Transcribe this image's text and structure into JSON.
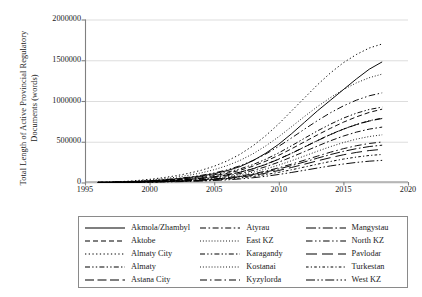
{
  "chart_data": {
    "type": "line",
    "title": "",
    "xlabel": "",
    "ylabel": "Total Length of Active Provincial Regulatory Documents (words)",
    "ylabel_line1": "Total Length of Active Provincial Regulatory",
    "ylabel_line2": "Documents (words)",
    "xlim": [
      1995,
      2020
    ],
    "ylim": [
      0,
      2000000
    ],
    "xticks": [
      1995,
      2000,
      2005,
      2010,
      2015,
      2020
    ],
    "xtick_labels": [
      "1995",
      "2000",
      "2005",
      "2010",
      "2015",
      "2020"
    ],
    "yticks": [
      0,
      500000,
      1000000,
      1500000,
      2000000
    ],
    "ytick_labels": [
      "0",
      "500000",
      "1000000",
      "1500000",
      "2000000"
    ],
    "grid": "horizontal",
    "legend_position": "below",
    "legend_columns": 3,
    "legend_rows": 5,
    "line_color": "#000000",
    "grid_color": "#d9d9d9",
    "axis_color": "#808080",
    "x": [
      1996,
      1997,
      1998,
      1999,
      2000,
      2001,
      2002,
      2003,
      2004,
      2005,
      2006,
      2007,
      2008,
      2009,
      2010,
      2011,
      2012,
      2013,
      2014,
      2015,
      2016,
      2017,
      2018
    ],
    "series": [
      {
        "name": "Akmola/Zhambyl",
        "dash": "solid",
        "values": [
          1000,
          3000,
          7000,
          13000,
          21000,
          31000,
          44000,
          60000,
          80000,
          108000,
          145000,
          195000,
          268000,
          360000,
          470000,
          600000,
          740000,
          880000,
          1010000,
          1140000,
          1270000,
          1390000,
          1480000
        ]
      },
      {
        "name": "Aktobe",
        "dash": "dashed",
        "values": [
          800,
          2200,
          5000,
          9000,
          15000,
          23000,
          33000,
          46000,
          62000,
          84000,
          112000,
          150000,
          200000,
          262000,
          334000,
          415000,
          500000,
          585000,
          665000,
          740000,
          805000,
          860000,
          900000
        ]
      },
      {
        "name": "Almaty City",
        "dash": "dotted",
        "values": [
          2000,
          6000,
          13000,
          24000,
          39000,
          58000,
          82000,
          112000,
          150000,
          200000,
          264000,
          346000,
          450000,
          576000,
          720000,
          880000,
          1040000,
          1200000,
          1345000,
          1470000,
          1570000,
          1650000,
          1700000
        ]
      },
      {
        "name": "Almaty",
        "dash": "dashdotdot",
        "values": [
          700,
          1900,
          4200,
          7800,
          12800,
          19500,
          28000,
          39000,
          53000,
          71000,
          95000,
          127000,
          170000,
          224000,
          288000,
          360000,
          438000,
          516000,
          590000,
          656000,
          712000,
          758000,
          790000
        ]
      },
      {
        "name": "Astana City",
        "dash": "longdash",
        "values": [
          600,
          1700,
          3900,
          7300,
          12000,
          18500,
          27000,
          38000,
          52000,
          70000,
          94000,
          126000,
          168000,
          222000,
          286000,
          358000,
          436000,
          514000,
          588000,
          654000,
          710000,
          754000,
          785000
        ]
      },
      {
        "name": "Atyrau",
        "dash": "dashdot",
        "values": [
          500,
          1500,
          3400,
          6400,
          10500,
          16200,
          23500,
          33000,
          45000,
          61000,
          82000,
          110000,
          147000,
          194000,
          250000,
          313000,
          380000,
          448000,
          512000,
          570000,
          618000,
          655000,
          680000
        ]
      },
      {
        "name": "East KZ",
        "dash": "fine-dotted",
        "values": [
          1500,
          4500,
          10000,
          18500,
          30000,
          45000,
          64000,
          88000,
          118000,
          157000,
          207000,
          271000,
          352000,
          450000,
          562000,
          686000,
          812000,
          932000,
          1042000,
          1140000,
          1222000,
          1286000,
          1330000
        ]
      },
      {
        "name": "Karagandy",
        "dash": "dashdotdot",
        "values": [
          900,
          2600,
          5800,
          10800,
          17500,
          26500,
          38000,
          52500,
          71000,
          95000,
          126000,
          167000,
          220000,
          286000,
          364000,
          452000,
          544000,
          634000,
          716000,
          790000,
          850000,
          896000,
          925000
        ]
      },
      {
        "name": "Kostanai",
        "dash": "fine-dotted",
        "values": [
          450,
          1300,
          3000,
          5600,
          9200,
          14200,
          20500,
          28500,
          39000,
          52500,
          70500,
          94500,
          126000,
          166000,
          214000,
          268000,
          326000,
          384000,
          440000,
          490000,
          532000,
          564000,
          585000
        ]
      },
      {
        "name": "Kyzylorda",
        "dash": "dashdot-wide",
        "values": [
          400,
          1100,
          2500,
          4700,
          7700,
          11900,
          17300,
          24100,
          33000,
          44500,
          59500,
          79500,
          106000,
          140000,
          180000,
          226000,
          275000,
          324000,
          372000,
          415000,
          451000,
          479000,
          497000
        ]
      },
      {
        "name": "Mangystau",
        "dash": "longdash-dot",
        "values": [
          350,
          1000,
          2300,
          4300,
          7100,
          11000,
          16000,
          22300,
          30500,
          41000,
          55000,
          73500,
          98000,
          129000,
          166000,
          208000,
          253000,
          299000,
          343000,
          382000,
          415000,
          441000,
          458000
        ]
      },
      {
        "name": "North KZ",
        "dash": "dashdotdot-wide",
        "values": [
          1100,
          3200,
          7200,
          13400,
          21800,
          33000,
          47000,
          65000,
          88000,
          117000,
          155000,
          205000,
          270000,
          350000,
          444000,
          548000,
          656000,
          760000,
          856000,
          940000,
          1010000,
          1064000,
          1100000
        ]
      },
      {
        "name": "Pavlodar",
        "dash": "longdash-wide",
        "values": [
          300,
          900,
          2000,
          3800,
          6300,
          9700,
          14100,
          19700,
          27000,
          36400,
          48800,
          65200,
          87000,
          114500,
          147500,
          185000,
          225000,
          266000,
          305000,
          340000,
          369000,
          392000,
          407000
        ]
      },
      {
        "name": "Turkestan",
        "dash": "dotted-dash",
        "values": [
          250,
          750,
          1700,
          3200,
          5300,
          8200,
          11900,
          16600,
          22800,
          30800,
          41300,
          55200,
          73600,
          97000,
          125000,
          156500,
          190500,
          225000,
          258000,
          287500,
          312000,
          331500,
          344000
        ]
      },
      {
        "name": "West KZ",
        "dash": "longdash-dotdot",
        "values": [
          200,
          600,
          1350,
          2550,
          4200,
          6500,
          9400,
          13100,
          18000,
          24300,
          32600,
          43600,
          58100,
          76500,
          98600,
          123500,
          150300,
          177500,
          203500,
          226800,
          246200,
          261600,
          271500
        ]
      }
    ]
  },
  "legend": {
    "entries": [
      {
        "label": "Akmola/Zhambyl",
        "style": "solid"
      },
      {
        "label": "Aktobe",
        "style": "dashed"
      },
      {
        "label": "Almaty City",
        "style": "dotted"
      },
      {
        "label": "Almaty",
        "style": "dashdotdot"
      },
      {
        "label": "Astana City",
        "style": "longdash"
      },
      {
        "label": "Atyrau",
        "style": "dashdot"
      },
      {
        "label": "East KZ",
        "style": "fine-dotted"
      },
      {
        "label": "Karagandy",
        "style": "dashdotdot"
      },
      {
        "label": "Kostanai",
        "style": "fine-dotted"
      },
      {
        "label": "Kyzylorda",
        "style": "dashdot-wide"
      },
      {
        "label": "Mangystau",
        "style": "longdash-dot"
      },
      {
        "label": "North KZ",
        "style": "dashdotdot-wide"
      },
      {
        "label": "Pavlodar",
        "style": "longdash-wide"
      },
      {
        "label": "Turkestan",
        "style": "dotted-dash"
      },
      {
        "label": "West KZ",
        "style": "longdash-dotdot"
      }
    ]
  }
}
